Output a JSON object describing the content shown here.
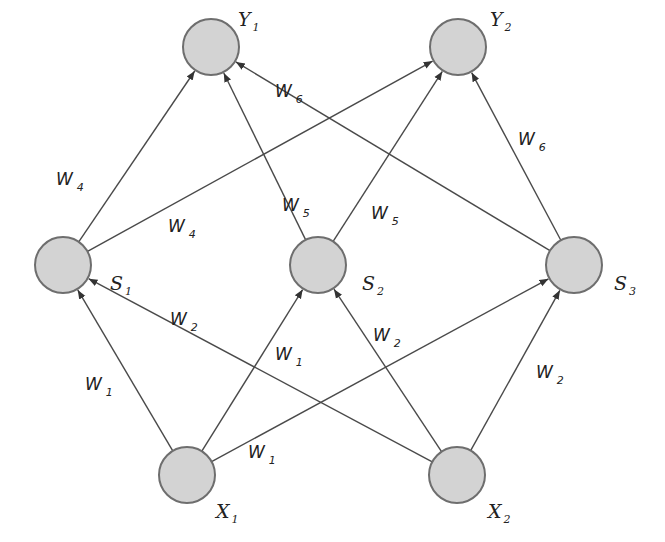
{
  "diagram": {
    "type": "neural-network",
    "nodes": [
      {
        "id": "Y1",
        "base": "Y",
        "sub": "1",
        "x": 211,
        "y": 47,
        "lx": 238,
        "ly": 26
      },
      {
        "id": "Y2",
        "base": "Y",
        "sub": "2",
        "x": 458,
        "y": 47,
        "lx": 490,
        "ly": 26
      },
      {
        "id": "S1",
        "base": "S",
        "sub": "1",
        "x": 63,
        "y": 265,
        "lx": 110,
        "ly": 290
      },
      {
        "id": "S2",
        "base": "S",
        "sub": "2",
        "x": 318,
        "y": 265,
        "lx": 362,
        "ly": 290
      },
      {
        "id": "S3",
        "base": "S",
        "sub": "3",
        "x": 574,
        "y": 265,
        "lx": 614,
        "ly": 290
      },
      {
        "id": "X1",
        "base": "X",
        "sub": "1",
        "x": 187,
        "y": 475,
        "lx": 216,
        "ly": 518
      },
      {
        "id": "X2",
        "base": "X",
        "sub": "2",
        "x": 457,
        "y": 475,
        "lx": 488,
        "ly": 518
      }
    ],
    "edges": [
      {
        "from": "X1",
        "to": "S1",
        "weight": "W1"
      },
      {
        "from": "X1",
        "to": "S2",
        "weight": "W1"
      },
      {
        "from": "X1",
        "to": "S3",
        "weight": "W1"
      },
      {
        "from": "X2",
        "to": "S1",
        "weight": "W2"
      },
      {
        "from": "X2",
        "to": "S2",
        "weight": "W2"
      },
      {
        "from": "X2",
        "to": "S3",
        "weight": "W2"
      },
      {
        "from": "S1",
        "to": "Y1",
        "weight": "W4"
      },
      {
        "from": "S1",
        "to": "Y2",
        "weight": "W4"
      },
      {
        "from": "S2",
        "to": "Y1",
        "weight": "W5"
      },
      {
        "from": "S2",
        "to": "Y2",
        "weight": "W5"
      },
      {
        "from": "S3",
        "to": "Y1",
        "weight": "W6"
      },
      {
        "from": "S3",
        "to": "Y2",
        "weight": "W6"
      }
    ],
    "weight_labels": [
      {
        "base": "W",
        "sub": "1",
        "x": 85,
        "y": 390
      },
      {
        "base": "W",
        "sub": "1",
        "x": 275,
        "y": 360
      },
      {
        "base": "W",
        "sub": "1",
        "x": 248,
        "y": 458
      },
      {
        "base": "W",
        "sub": "2",
        "x": 170,
        "y": 325
      },
      {
        "base": "W",
        "sub": "2",
        "x": 373,
        "y": 341
      },
      {
        "base": "W",
        "sub": "2",
        "x": 536,
        "y": 378
      },
      {
        "base": "W",
        "sub": "4",
        "x": 56,
        "y": 185
      },
      {
        "base": "W",
        "sub": "4",
        "x": 168,
        "y": 232
      },
      {
        "base": "W",
        "sub": "5",
        "x": 282,
        "y": 211
      },
      {
        "base": "W",
        "sub": "5",
        "x": 371,
        "y": 219
      },
      {
        "base": "W",
        "sub": "6",
        "x": 275,
        "y": 97
      },
      {
        "base": "W",
        "sub": "6",
        "x": 518,
        "y": 145
      }
    ],
    "colors": {
      "node_fill": "#d3d3d3",
      "node_stroke": "#6e6e6e",
      "edge": "#4a4a4a",
      "text": "#222222"
    }
  }
}
